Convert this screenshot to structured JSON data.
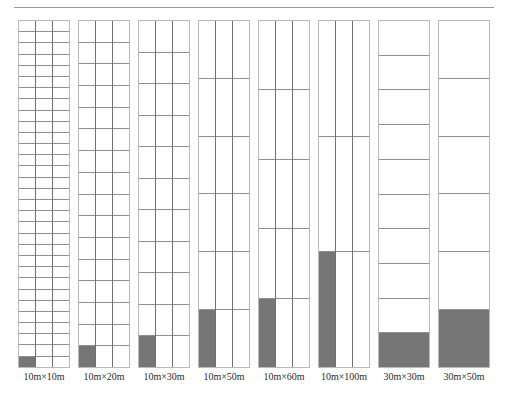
{
  "figure": {
    "top_text": "",
    "caption": "",
    "gray_color": "#767676",
    "frame_color": "#b9b9b9",
    "row_line_color": "#8f8f8f",
    "col_line_color": "#6f6f6f"
  },
  "chart_data": {
    "type": "bar",
    "title": "",
    "subtitle": "",
    "xlabel": "",
    "ylabel": "",
    "grid": true,
    "legend": "none",
    "ylim": [
      0,
      1
    ],
    "note": "Each column is a full-height rectangle subdivided into a grid of cells; the shaded (gray) area at the bottom represents the occupied/sampled fraction. Sub-columns = 3 for the first six categories and 1 for the last two.",
    "categories": [
      "10m×10m",
      "10m×20m",
      "10m×30m",
      "10m×50m",
      "10m×60m",
      "10m×100m",
      "30m×30m",
      "30m×50m"
    ],
    "rows": [
      31,
      16,
      11,
      6,
      5,
      3,
      10,
      6
    ],
    "subcolumns": [
      3,
      3,
      3,
      3,
      3,
      3,
      1,
      1
    ],
    "filled_cells": [
      1,
      1,
      1,
      1,
      1,
      1,
      1,
      1
    ],
    "filled_fraction": [
      0.0108,
      0.0208,
      0.0303,
      0.0556,
      0.0667,
      0.1111,
      0.1,
      0.1667
    ],
    "values": [
      1.08,
      2.08,
      3.03,
      5.56,
      6.67,
      11.11,
      10.0,
      16.67
    ]
  },
  "labels": [
    "10m×10m",
    "10m×20m",
    "10m×30m",
    "10m×50m",
    "10m×60m",
    "10m×100m",
    "30m×30m",
    "30m×50m"
  ]
}
